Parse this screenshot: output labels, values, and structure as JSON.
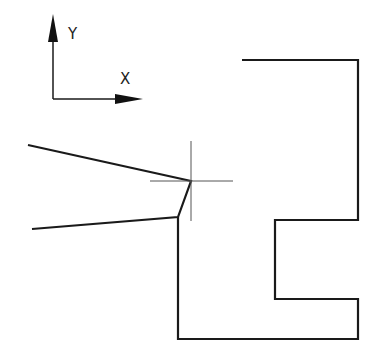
{
  "diagram": {
    "width": 377,
    "height": 355,
    "stroke_color": "#1a1a1a",
    "crosshair_color": "#555555",
    "axes": {
      "origin": [
        53,
        99
      ],
      "y_tip": [
        53,
        14
      ],
      "x_tip": [
        143,
        99
      ],
      "x_label": "X",
      "y_label": "Y",
      "x_label_pos": [
        120,
        84
      ],
      "y_label_pos": [
        68,
        39
      ]
    },
    "wedge_shape": {
      "points": "28,145 191,181 178,217 32,229"
    },
    "main_shape": {
      "points": "178,217 178,339 358,339 358,299 275,299 275,220 358,220 358,60 242,60"
    },
    "crosshair": {
      "center": [
        191,
        181
      ],
      "h_from": 150,
      "h_to": 233,
      "v_from": 141,
      "v_to": 221
    }
  }
}
